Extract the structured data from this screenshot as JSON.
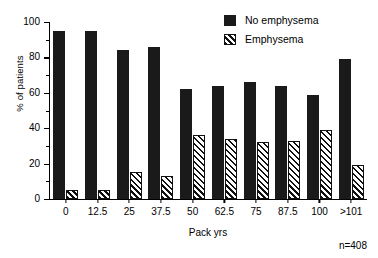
{
  "chart_data": {
    "type": "bar",
    "title": "",
    "xlabel": "Pack yrs",
    "ylabel": "% of patients",
    "categories": [
      "0",
      "12.5",
      "25",
      "37.5",
      "50",
      "62.5",
      "75",
      "87.5",
      "100",
      ">101"
    ],
    "series": [
      {
        "name": "No emphysema",
        "style": "solid",
        "color": "#1a1a1a",
        "values": [
          95,
          95,
          84,
          86,
          62,
          64,
          66,
          64,
          59,
          79
        ]
      },
      {
        "name": "Emphysema",
        "style": "hatched",
        "color": "#111111",
        "values": [
          5,
          5,
          15,
          13,
          36,
          34,
          32,
          33,
          39,
          19
        ]
      }
    ],
    "ylim": [
      0,
      100
    ],
    "yticks": [
      0,
      20,
      40,
      60,
      80,
      100
    ],
    "yticks_minor": [
      10,
      30,
      50,
      70,
      90
    ],
    "grid": false,
    "legend_position": "top-right",
    "annotation": "n=408"
  },
  "axes": {
    "y_label": "% of patients",
    "x_label": "Pack yrs",
    "y_tick_labels": [
      "0",
      "20",
      "40",
      "60",
      "80",
      "100"
    ],
    "x_tick_labels": [
      "0",
      "12.5",
      "25",
      "37.5",
      "50",
      "62.5",
      "75",
      "87.5",
      "100",
      ">101"
    ]
  },
  "legend": {
    "items": [
      {
        "label": "No emphysema",
        "swatch": "solid-square-icon"
      },
      {
        "label": "Emphysema",
        "swatch": "hatched-square-icon"
      }
    ]
  },
  "footnote": {
    "sample_size": "n=408"
  }
}
